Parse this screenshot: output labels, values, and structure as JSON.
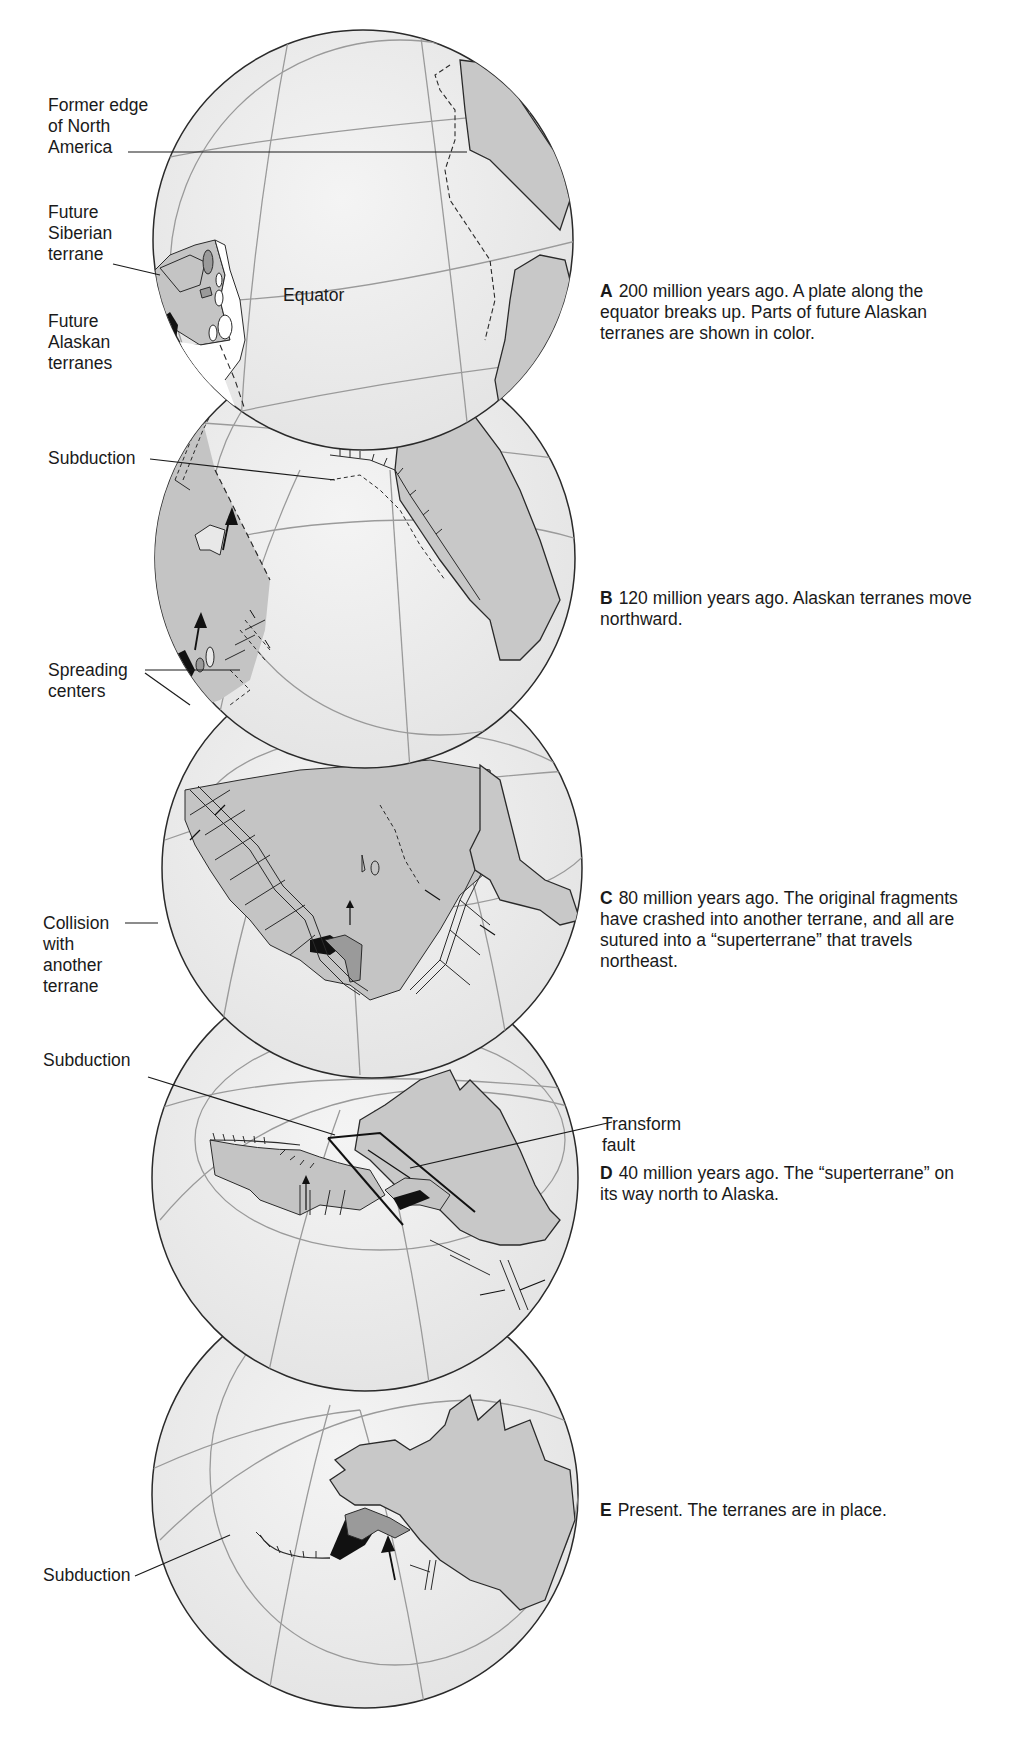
{
  "figure": {
    "colors": {
      "background": "#ffffff",
      "ocean": "#ececec",
      "plate_gray": "#c4c4c4",
      "continent_gray": "#c8c8c8",
      "terrane_dark": "#111111",
      "terrane_mid": "#9a9a9a",
      "outline": "#2a2a2a",
      "grid": "#9a9a9a",
      "white_region": "#ffffff"
    },
    "globes": [
      {
        "id": "A",
        "caption_letter": "A",
        "caption_text": "200 million years ago.  A plate along the equator breaks up. Parts of future Alaskan terranes are shown in color.",
        "inline_labels": {
          "equator": "Equator"
        },
        "left_labels": [
          {
            "text": "Former edge\nof North\nAmerica"
          },
          {
            "text": "Future\nSiberian\nterrane"
          },
          {
            "text": "Future\nAlaskan\nterranes"
          }
        ]
      },
      {
        "id": "B",
        "caption_letter": "B",
        "caption_text": "120 million years ago. Alaskan terranes move northward.",
        "left_labels": [
          {
            "text": "Subduction"
          },
          {
            "text": "Spreading\ncenters"
          }
        ]
      },
      {
        "id": "C",
        "caption_letter": "C",
        "caption_text": "80 million years ago. The original fragments have crashed into another terrane, and all are sutured into a “superterrane” that travels northeast.",
        "left_labels": [
          {
            "text": "Collision\nwith\nanother\nterrane"
          }
        ]
      },
      {
        "id": "D",
        "caption_letter": "D",
        "caption_text": "40 million years ago. The “superterrane” on its way north to Alaska.",
        "left_labels": [
          {
            "text": "Subduction"
          }
        ],
        "right_labels": [
          {
            "text": "Transform\nfault"
          }
        ]
      },
      {
        "id": "E",
        "caption_letter": "E",
        "caption_text": "Present. The terranes are in place.",
        "left_labels": [
          {
            "text": "Subduction"
          }
        ]
      }
    ]
  }
}
